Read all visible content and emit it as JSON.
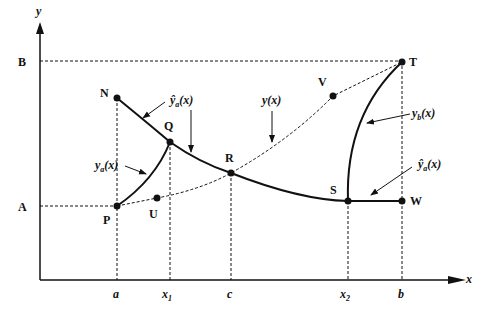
{
  "figure": {
    "axes": {
      "x_label": "x",
      "y_label": "y"
    },
    "y_ticks": [
      {
        "label": "B"
      },
      {
        "label": "A"
      }
    ],
    "x_ticks": [
      {
        "label": "a"
      },
      {
        "label": "x",
        "sub": "1"
      },
      {
        "label": "c"
      },
      {
        "label": "x",
        "sub": "2"
      },
      {
        "label": "b"
      }
    ],
    "points": {
      "N": "N",
      "Q": "Q",
      "R": "R",
      "S": "S",
      "W": "W",
      "T": "T",
      "P": "P",
      "U": "U",
      "V": "V"
    },
    "curve_labels": {
      "y_hat_a": {
        "base": "ŷ",
        "sub": "a",
        "arg": "(x)"
      },
      "y": {
        "text": "y(x)"
      },
      "y_a": {
        "base": "y",
        "sub": "a",
        "arg": "(x)"
      },
      "y_b": {
        "base": "y",
        "sub": "b",
        "arg": "(x)"
      },
      "y_hat_b": {
        "base": "ŷ",
        "sub": "a",
        "arg": "(x)"
      }
    },
    "colors": {
      "ink": "#111111",
      "background": "#ffffff"
    }
  }
}
